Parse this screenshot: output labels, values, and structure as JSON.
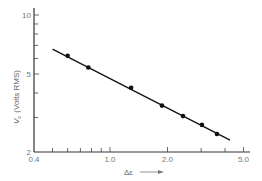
{
  "chart_data": {
    "type": "scatter",
    "title": "",
    "xlabel": "Δε",
    "xlabel_arrow": "→",
    "ylabel": "V_c (Volts RMS)",
    "ylabel_symbol": "V",
    "ylabel_subscript": "c",
    "ylabel_units": "(Volts RMS)",
    "xscale": "log",
    "yscale": "log",
    "xlim": [
      0.4,
      5.0
    ],
    "ylim": [
      2,
      10
    ],
    "grid": false,
    "legend": null,
    "x_tick_labels": [
      {
        "value": 0.4,
        "label": "0.4"
      },
      {
        "value": 1.0,
        "label": "1.0"
      },
      {
        "value": 2.0,
        "label": "2.0"
      },
      {
        "value": 5.0,
        "label": "5.0"
      }
    ],
    "x_minor_ticks": [
      0.5,
      0.6,
      0.7,
      0.8,
      0.9,
      3.0,
      4.0
    ],
    "y_tick_labels": [
      {
        "value": 2,
        "label": "2"
      },
      {
        "value": 5,
        "label": "5"
      },
      {
        "value": 10,
        "label": "10"
      }
    ],
    "y_minor_ticks": [
      3,
      4,
      6,
      7,
      8,
      9
    ],
    "series": [
      {
        "name": "measured",
        "marker": "filled-circle",
        "x": [
          0.6,
          0.77,
          1.29,
          1.87,
          2.41,
          3.03,
          3.63
        ],
        "y": [
          6.2,
          5.4,
          4.25,
          3.45,
          3.05,
          2.75,
          2.47
        ]
      },
      {
        "name": "fit-line",
        "style": "solid-line",
        "x": [
          0.5,
          4.25
        ],
        "y": [
          6.7,
          2.3
        ]
      }
    ]
  }
}
